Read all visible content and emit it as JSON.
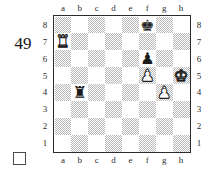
{
  "diagram": {
    "number": "49",
    "side_to_move_marker": "white-square",
    "side_to_move": "white"
  },
  "board": {
    "files_top": [
      "a",
      "b",
      "c",
      "d",
      "e",
      "f",
      "g",
      "h"
    ],
    "files_bottom": [
      "a",
      "b",
      "c",
      "d",
      "e",
      "f",
      "g",
      "h"
    ],
    "ranks_left": [
      "8",
      "7",
      "6",
      "5",
      "4",
      "3",
      "2",
      "1"
    ],
    "ranks_right": [
      "8",
      "7",
      "6",
      "5",
      "4",
      "3",
      "2",
      "1"
    ],
    "light_square_color": "#ffffff",
    "dark_square_color": "#b9b9b9",
    "border_color": "#2b2b2b",
    "orientation": "white-bottom"
  },
  "pieces": [
    {
      "square": "f8",
      "file": 5,
      "rank": 7,
      "color": "black",
      "type": "king",
      "glyph": "♚",
      "name": "black-king-f8"
    },
    {
      "square": "a7",
      "file": 0,
      "rank": 6,
      "color": "white",
      "type": "rook",
      "glyph": "♜",
      "name": "white-rook-a7"
    },
    {
      "square": "f6",
      "file": 5,
      "rank": 5,
      "color": "black",
      "type": "pawn",
      "glyph": "♟",
      "name": "black-pawn-f6"
    },
    {
      "square": "f5",
      "file": 5,
      "rank": 4,
      "color": "white",
      "type": "pawn",
      "glyph": "♟",
      "name": "white-pawn-f5"
    },
    {
      "square": "h5",
      "file": 7,
      "rank": 4,
      "color": "white",
      "type": "king",
      "glyph": "♚",
      "name": "white-king-h5"
    },
    {
      "square": "b4",
      "file": 1,
      "rank": 3,
      "color": "black",
      "type": "rook",
      "glyph": "♜",
      "name": "black-rook-b4"
    },
    {
      "square": "g4",
      "file": 6,
      "rank": 3,
      "color": "white",
      "type": "pawn",
      "glyph": "♟",
      "name": "white-pawn-g4"
    }
  ],
  "chart_data": {
    "type": "table",
    "fen_placement": "5k2/R7/5p2/5P1K/1r4P1/8/8/8",
    "white_pieces": [
      "Ra7",
      "Kh5",
      "Pf5",
      "Pg4"
    ],
    "black_pieces": [
      "Kf8",
      "Pf6",
      "Rb4"
    ]
  }
}
